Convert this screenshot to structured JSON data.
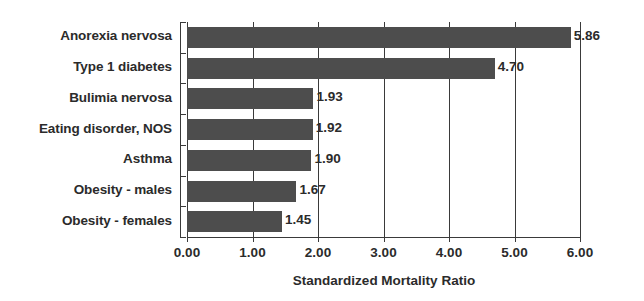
{
  "chart_data": {
    "type": "bar",
    "orientation": "horizontal",
    "title": "",
    "xlabel": "Standardized Mortality Ratio",
    "ylabel": "",
    "categories": [
      "Anorexia nervosa",
      "Type 1 diabetes",
      "Bulimia nervosa",
      "Eating disorder, NOS",
      "Asthma",
      "Obesity - males",
      "Obesity - females"
    ],
    "values": [
      5.86,
      4.7,
      1.93,
      1.92,
      1.9,
      1.67,
      1.45
    ],
    "value_labels": [
      "5.86",
      "4.70",
      "1.93",
      "1.92",
      "1.90",
      "1.67",
      "1.45"
    ],
    "xlim": [
      0.0,
      6.0
    ],
    "xticks": [
      0.0,
      1.0,
      2.0,
      3.0,
      4.0,
      5.0,
      6.0
    ],
    "xtick_labels": [
      "0.00",
      "1.00",
      "2.00",
      "3.00",
      "4.00",
      "5.00",
      "6.00"
    ],
    "grid": "vertical",
    "legend": "none",
    "bar_color": "#4d4d4d",
    "axis_color": "#3a3a3a",
    "text_color": "#2b2b2b",
    "background": "#ffffff"
  }
}
